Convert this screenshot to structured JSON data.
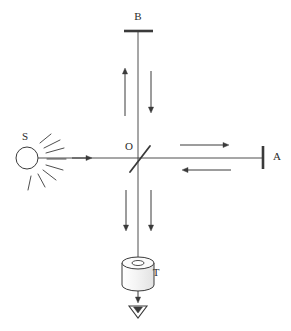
{
  "figure": {
    "background_color": "#ffffff",
    "stroke_color": "#3a3a3a",
    "label_color": "#2b2b2b",
    "fill_gray": "#f2f2f2"
  },
  "labels": {
    "source": "S",
    "mirror_top": "B",
    "mirror_right": "A",
    "beam_splitter": "O",
    "detector": "T"
  },
  "components": {
    "source": {
      "name": "light-source",
      "label": "S",
      "cx": 27,
      "cy": 158,
      "r": 11,
      "label_x": 25,
      "label_y": 137,
      "rays": [
        [
          40,
          143,
          51,
          134
        ],
        [
          44,
          148,
          60,
          140
        ],
        [
          46,
          153,
          64,
          148
        ],
        [
          47,
          159,
          66,
          159
        ],
        [
          46,
          165,
          63,
          170
        ],
        [
          43,
          170,
          56,
          180
        ],
        [
          38,
          174,
          45,
          187
        ],
        [
          31,
          176,
          28,
          190
        ]
      ]
    },
    "mirror_top": {
      "name": "mirror-b",
      "label": "B",
      "x1": 124,
      "y1": 31,
      "x2": 153,
      "y2": 31,
      "label_x": 138,
      "label_y": 17
    },
    "mirror_right": {
      "name": "mirror-a",
      "label": "A",
      "x1": 263,
      "y1": 146,
      "x2": 263,
      "y2": 169,
      "label_x": 277,
      "label_y": 157
    },
    "beam_splitter": {
      "name": "beam-splitter",
      "label": "O",
      "x1": 130,
      "y1": 172,
      "x2": 150,
      "y2": 146,
      "label_x": 129,
      "label_y": 147
    },
    "detector": {
      "name": "detector-t",
      "label": "T",
      "cx": 138,
      "cy_top": 263,
      "rx": 16,
      "ry": 6,
      "body_height": 22,
      "hole_rx": 6,
      "hole_ry": 2.5,
      "label_x": 156,
      "label_y": 273
    },
    "funnel": {
      "name": "output-funnel",
      "cx": 138,
      "top_y": 306,
      "half_width": 9,
      "bottom_y": 318
    }
  },
  "beam_paths": {
    "horizontal_axis": {
      "x1": 38,
      "y1": 158,
      "x2": 263,
      "y2": 158
    },
    "vertical_axis": {
      "x1": 138,
      "y1": 31,
      "x2": 138,
      "y2": 263
    }
  },
  "arrows": [
    {
      "name": "arrow-source-to-splitter",
      "dir": "right",
      "x1": 72,
      "y1": 158,
      "x2": 92,
      "y2": 158
    },
    {
      "name": "arrow-splitter-to-mirror-a",
      "dir": "right",
      "x1": 180,
      "y1": 145,
      "x2": 229,
      "y2": 145
    },
    {
      "name": "arrow-mirror-a-to-splitter",
      "dir": "left",
      "x1": 231,
      "y1": 170,
      "x2": 182,
      "y2": 170
    },
    {
      "name": "arrow-splitter-to-mirror-b",
      "dir": "up",
      "x1": 125,
      "y1": 116,
      "x2": 125,
      "y2": 68
    },
    {
      "name": "arrow-mirror-b-to-splitter",
      "dir": "down",
      "x1": 151,
      "y1": 71,
      "x2": 151,
      "y2": 113
    },
    {
      "name": "arrow-output-left",
      "dir": "down",
      "x1": 126,
      "y1": 190,
      "x2": 126,
      "y2": 231
    },
    {
      "name": "arrow-output-right",
      "dir": "down",
      "x1": 151,
      "y1": 190,
      "x2": 151,
      "y2": 231
    },
    {
      "name": "arrow-detector-output",
      "dir": "down",
      "x1": 138,
      "y1": 289,
      "x2": 138,
      "y2": 303
    }
  ]
}
